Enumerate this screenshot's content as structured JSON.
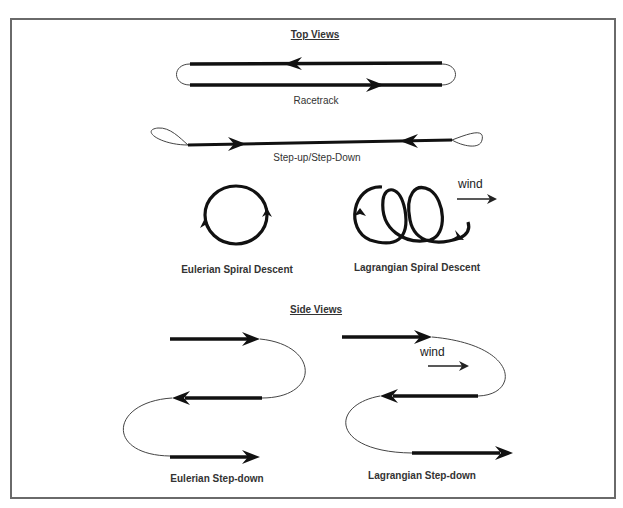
{
  "top_views": {
    "heading": "Top Views",
    "racetrack": {
      "label": "Racetrack"
    },
    "step_up_down": {
      "label": "Step-up/Step-Down"
    },
    "eulerian_spiral": {
      "label": "Eulerian Spiral Descent"
    },
    "lagrangian_spiral": {
      "label": "Lagrangian Spiral Descent",
      "wind_label": "wind"
    }
  },
  "side_views": {
    "heading": "Side Views",
    "eulerian_stepdown": {
      "label": "Eulerian Step-down"
    },
    "lagrangian_stepdown": {
      "label": "Lagrangian Step-down",
      "wind_label": "wind"
    }
  },
  "colors": {
    "stroke": "#111111",
    "thin_stroke": "#444444",
    "border": "#6a6a6a"
  }
}
